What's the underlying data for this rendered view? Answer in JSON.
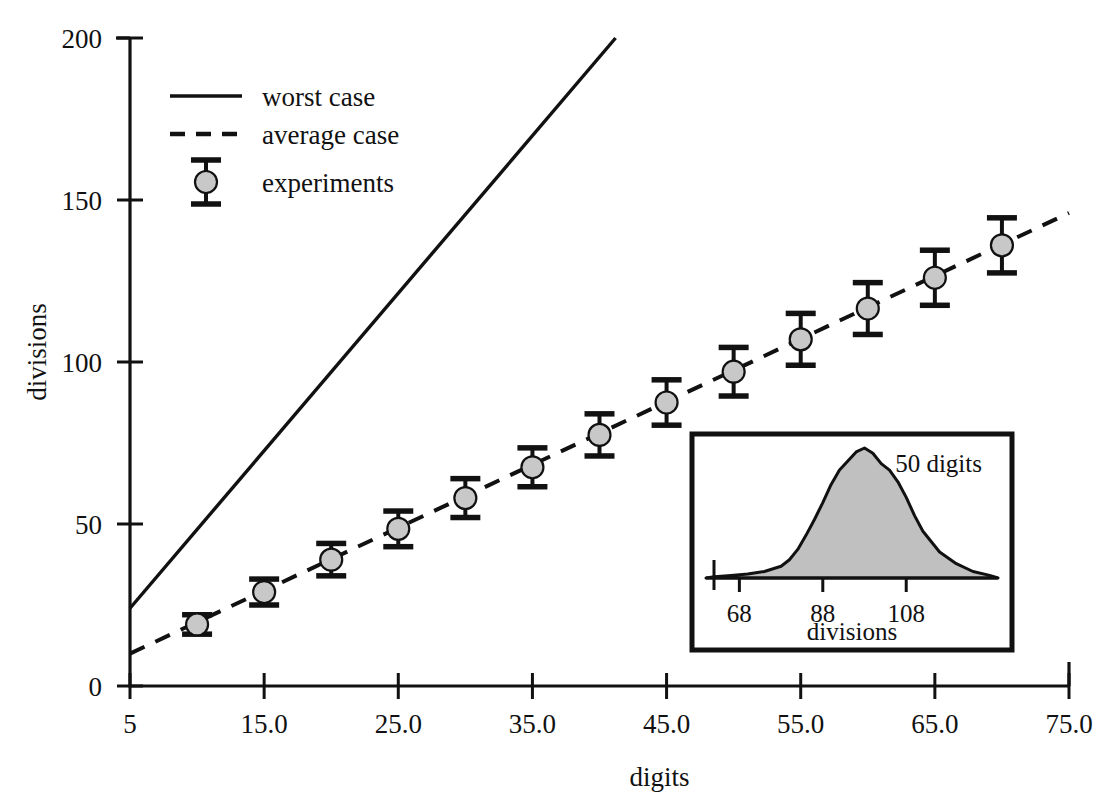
{
  "figure": {
    "background": "#ffffff",
    "ink_color": "#111111",
    "marker_fill": "#c8c8c8",
    "inset_fill": "#c0c0c0"
  },
  "axes": {
    "xlabel": "digits",
    "ylabel": "divisions",
    "xticks": [
      "5",
      "15.0",
      "25.0",
      "35.0",
      "45.0",
      "55.0",
      "65.0",
      "75.0"
    ],
    "yticks": [
      "0",
      "50",
      "100",
      "150",
      "200"
    ]
  },
  "legend": {
    "items": [
      {
        "label": "worst case",
        "style": "solid-line"
      },
      {
        "label": "average case",
        "style": "dashed-line"
      },
      {
        "label": "experiments",
        "style": "errorbar-marker"
      }
    ]
  },
  "inset": {
    "title": "50 digits",
    "xlabel": "divisions",
    "xticks": [
      "68",
      "88",
      "108"
    ]
  },
  "chart_data": {
    "type": "line",
    "title": "",
    "xlabel": "digits",
    "ylabel": "divisions",
    "xlim": [
      5,
      75
    ],
    "ylim": [
      0,
      200
    ],
    "grid": false,
    "legend_position": "upper-left-inside",
    "xtick_values": [
      5,
      15,
      25,
      35,
      45,
      55,
      65,
      75
    ],
    "ytick_values": [
      0,
      50,
      100,
      150,
      200
    ],
    "series": [
      {
        "name": "worst case",
        "type": "line",
        "style": "solid",
        "x": [
          5,
          41.2
        ],
        "values": [
          24,
          200
        ]
      },
      {
        "name": "average case",
        "type": "line",
        "style": "dashed",
        "x": [
          5,
          75
        ],
        "values": [
          10,
          146
        ]
      },
      {
        "name": "experiments",
        "type": "scatter-errorbar",
        "x": [
          10,
          15,
          20,
          25,
          30,
          35,
          40,
          45,
          50,
          55,
          60,
          65,
          70
        ],
        "values": [
          19,
          29,
          39,
          48.5,
          58,
          67.5,
          77.5,
          87.5,
          97,
          107,
          116.5,
          126,
          136
        ],
        "errors": [
          3,
          4,
          5,
          5.5,
          6,
          6,
          6.5,
          7,
          7.5,
          8,
          8,
          8.5,
          8.5
        ]
      }
    ],
    "inset_chart": {
      "type": "area",
      "title": "50 digits",
      "xlabel": "divisions",
      "xtick_values": [
        68,
        88,
        108
      ],
      "x": [
        62,
        66,
        70,
        74,
        78,
        80,
        82,
        84,
        86,
        88,
        90,
        92,
        94,
        96,
        98,
        100,
        102,
        104,
        106,
        108,
        110,
        112,
        116,
        120,
        124,
        128
      ],
      "values": [
        1,
        2,
        3,
        5,
        9,
        14,
        22,
        33,
        45,
        58,
        72,
        83,
        90,
        97,
        100,
        96,
        88,
        83,
        74,
        62,
        48,
        36,
        20,
        11,
        5,
        2
      ]
    }
  }
}
